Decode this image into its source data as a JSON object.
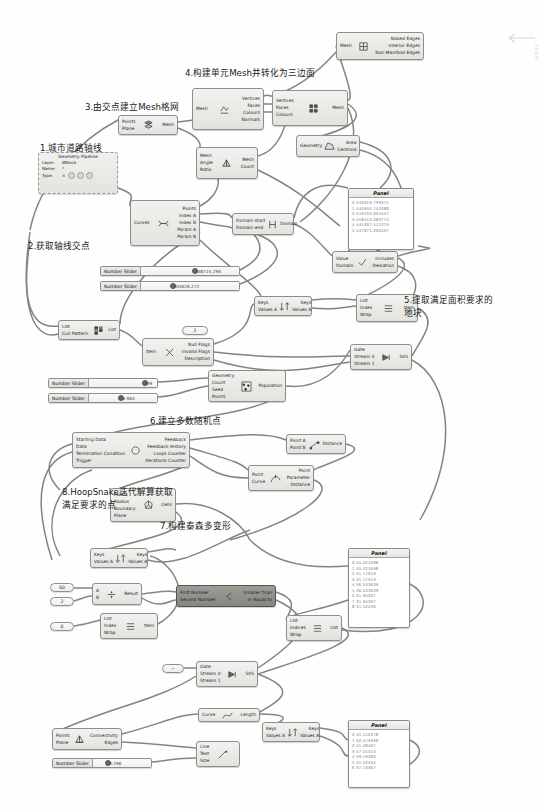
{
  "document": {
    "title": "Grasshopper Definition Canvas",
    "watermark": "ZOOM"
  },
  "annotations": [
    {
      "id": "a1",
      "text": "1.城市道路轴线",
      "x": 40,
      "y": 141
    },
    {
      "id": "a2",
      "text": "2.获取轴线交点",
      "x": 28,
      "y": 239
    },
    {
      "id": "a3",
      "text": "3.由交点建立Mesh格网",
      "x": 85,
      "y": 100
    },
    {
      "id": "a4",
      "text": "4.构建单元Mesh并转化为三边面",
      "x": 185,
      "y": 66
    },
    {
      "id": "a5a",
      "text": "5.提取满足面积要求的",
      "x": 404,
      "y": 293
    },
    {
      "id": "a5b",
      "text": "地块",
      "x": 404,
      "y": 306
    },
    {
      "id": "a6",
      "text": "6.建立多数随机点",
      "x": 150,
      "y": 414
    },
    {
      "id": "a7",
      "text": "7.构建泰森多变形",
      "x": 160,
      "y": 519
    },
    {
      "id": "a8a",
      "text": "8.HoopSnake迭代解算获取",
      "x": 62,
      "y": 485
    },
    {
      "id": "a8b",
      "text": "满足要求的点",
      "x": 62,
      "y": 498
    }
  ],
  "nodes": [
    {
      "id": "n_mesh_edges",
      "name": "mesh-edges-node",
      "x": 336,
      "y": 32,
      "w": 88,
      "h": 28,
      "inputs": [
        "Mesh"
      ],
      "outputs": [
        "Naked Edges",
        "Interior Edges",
        "Non-Manifold Edges"
      ],
      "icon": "mesh-edges-icon",
      "dark": false
    },
    {
      "id": "n_deconstruct_mesh",
      "name": "deconstruct-mesh-node",
      "x": 192,
      "y": 88,
      "w": 72,
      "h": 42,
      "inputs": [
        "Mesh"
      ],
      "outputs": [
        "Vertices",
        "Faces",
        "Colours",
        "Normals"
      ],
      "icon": "deconstruct-mesh-icon",
      "dark": false
    },
    {
      "id": "n_construct_mesh",
      "name": "construct-mesh-node",
      "x": 272,
      "y": 90,
      "w": 76,
      "h": 36,
      "inputs": [
        "Vertices",
        "Faces",
        "Colours"
      ],
      "outputs": [
        "Mesh"
      ],
      "icon": "construct-mesh-icon",
      "dark": false
    },
    {
      "id": "n_mesh_grid",
      "name": "mesh-grid-node",
      "x": 118,
      "y": 115,
      "w": 60,
      "h": 20,
      "inputs": [
        "Points",
        "Plane"
      ],
      "outputs": [
        "Mesh"
      ],
      "icon": "mesh-grid-icon",
      "dark": false
    },
    {
      "id": "n_area",
      "name": "area-node",
      "x": 296,
      "y": 135,
      "w": 64,
      "h": 22,
      "inputs": [
        "Geometry"
      ],
      "outputs": [
        "Area",
        "Centroid"
      ],
      "icon": "area-icon",
      "dark": false
    },
    {
      "id": "n_triangulate",
      "name": "triangulate-mesh-node",
      "x": 196,
      "y": 147,
      "w": 62,
      "h": 32,
      "inputs": [
        "Mesh",
        "Angle",
        "Ratio"
      ],
      "outputs": [
        "Mesh",
        "Count"
      ],
      "icon": "triangulate-icon",
      "dark": false
    },
    {
      "id": "n_ccx",
      "name": "curve-curve-intersection-node",
      "x": 130,
      "y": 200,
      "w": 70,
      "h": 46,
      "inputs": [
        "Curves"
      ],
      "outputs": [
        "Points",
        "Index A",
        "Index B",
        "Param A",
        "Param B"
      ],
      "icon": "intersection-icon",
      "dark": false
    },
    {
      "id": "n_domain",
      "name": "construct-domain-node",
      "x": 232,
      "y": 213,
      "w": 62,
      "h": 22,
      "inputs": [
        "Domain start",
        "Domain end"
      ],
      "outputs": [
        "Domain"
      ],
      "icon": "domain-icon",
      "dark": false
    },
    {
      "id": "n_includes",
      "name": "includes-node",
      "x": 332,
      "y": 251,
      "w": 66,
      "h": 22,
      "inputs": [
        "Value",
        "Domain"
      ],
      "outputs": [
        "Includes",
        "Deviation"
      ],
      "icon": "includes-icon",
      "dark": false
    },
    {
      "id": "n_cull",
      "name": "cull-pattern-node",
      "x": 58,
      "y": 320,
      "w": 62,
      "h": 20,
      "inputs": [
        "List",
        "Cull Pattern"
      ],
      "outputs": [
        "List"
      ],
      "icon": "cull-pattern-icon",
      "dark": false
    },
    {
      "id": "n_nulls",
      "name": "null-item-node",
      "x": 142,
      "y": 338,
      "w": 72,
      "h": 28,
      "inputs": [
        "Item"
      ],
      "outputs": [
        "Null Flags",
        "Invalid Flags",
        "Description"
      ],
      "icon": "null-item-icon",
      "dark": false
    },
    {
      "id": "n_sort1",
      "name": "sort-list-node-1",
      "x": 254,
      "y": 296,
      "w": 58,
      "h": 20,
      "inputs": [
        "Keys",
        "Values A"
      ],
      "outputs": [
        "Keys",
        "Values A"
      ],
      "icon": "sort-icon",
      "dark": false
    },
    {
      "id": "n_listitem1",
      "name": "list-item-node-1",
      "x": 356,
      "y": 294,
      "w": 62,
      "h": 28,
      "inputs": [
        "List",
        "Index",
        "Wrap"
      ],
      "outputs": [
        "Item"
      ],
      "icon": "list-item-icon",
      "dark": false
    },
    {
      "id": "n_gate1",
      "name": "gate-stream-node-1",
      "x": 350,
      "y": 344,
      "w": 62,
      "h": 26,
      "inputs": [
        "Gate",
        "Stream 0",
        "Stream 1"
      ],
      "outputs": [
        "S0S"
      ],
      "icon": "stream-gate-icon",
      "dark": false
    },
    {
      "id": "n_populate",
      "name": "populate-geometry-node",
      "x": 208,
      "y": 370,
      "w": 78,
      "h": 32,
      "inputs": [
        "Geometry",
        "Count",
        "Seed",
        "Points"
      ],
      "outputs": [
        "Population"
      ],
      "icon": "populate-icon",
      "dark": false
    },
    {
      "id": "n_hoopsnake",
      "name": "hoopsnake-node",
      "x": 72,
      "y": 432,
      "w": 118,
      "h": 36,
      "inputs": [
        "Starting Data",
        "Data",
        "Termination Condition",
        "Trigger"
      ],
      "outputs": [
        "Feedback",
        "Feedback History",
        "Loops Counter",
        "Iterations Counter"
      ],
      "icon": "loop-icon",
      "dark": false
    },
    {
      "id": "n_distance",
      "name": "distance-node",
      "x": 286,
      "y": 434,
      "w": 60,
      "h": 20,
      "inputs": [
        "Point A",
        "Point B"
      ],
      "outputs": [
        "Distance"
      ],
      "icon": "distance-icon",
      "dark": false
    },
    {
      "id": "n_curvecp",
      "name": "curve-closest-point-node",
      "x": 248,
      "y": 465,
      "w": 66,
      "h": 26,
      "inputs": [
        "Point",
        "Curve"
      ],
      "outputs": [
        "Point",
        "Parameter",
        "Distance"
      ],
      "icon": "closest-point-icon",
      "dark": false
    },
    {
      "id": "n_voronoi",
      "name": "voronoi-node",
      "x": 110,
      "y": 488,
      "w": 66,
      "h": 34,
      "inputs": [
        "Points",
        "Radius",
        "Boundary",
        "Plane"
      ],
      "outputs": [
        "Cells"
      ],
      "icon": "voronoi-icon",
      "dark": false
    },
    {
      "id": "n_sort2",
      "name": "sort-list-node-2",
      "x": 90,
      "y": 548,
      "w": 58,
      "h": 20,
      "inputs": [
        "Keys",
        "Values A"
      ],
      "outputs": [
        "Keys",
        "Values A"
      ],
      "icon": "sort-icon",
      "dark": false
    },
    {
      "id": "n_divide",
      "name": "division-node",
      "x": 92,
      "y": 583,
      "w": 50,
      "h": 22,
      "inputs": [
        "A",
        "B"
      ],
      "outputs": [
        "Result"
      ],
      "icon": "division-icon",
      "dark": false
    },
    {
      "id": "n_smaller",
      "name": "smaller-than-node",
      "x": 176,
      "y": 585,
      "w": 100,
      "h": 22,
      "inputs": [
        "First Number",
        "Second Number"
      ],
      "outputs": [
        "Smaller than",
        "or Equal to"
      ],
      "icon": "less-than-icon",
      "dark": true
    },
    {
      "id": "n_listitem2",
      "name": "list-item-node-2",
      "x": 100,
      "y": 613,
      "w": 58,
      "h": 26,
      "inputs": [
        "List",
        "Index",
        "Wrap"
      ],
      "outputs": [
        "Item"
      ],
      "icon": "list-item-icon",
      "dark": false
    },
    {
      "id": "n_listitem3",
      "name": "list-item-node-3",
      "x": 286,
      "y": 615,
      "w": 56,
      "h": 26,
      "inputs": [
        "List",
        "Indices",
        "Wrap"
      ],
      "outputs": [
        "List"
      ],
      "icon": "list-item-icon",
      "dark": false
    },
    {
      "id": "n_gate2",
      "name": "gate-stream-node-2",
      "x": 196,
      "y": 661,
      "w": 62,
      "h": 26,
      "inputs": [
        "Gate",
        "Stream 0",
        "Stream 1"
      ],
      "outputs": [
        "S0S"
      ],
      "icon": "stream-gate-icon",
      "dark": false
    },
    {
      "id": "n_delaunay",
      "name": "delaunay-connectivity-node",
      "x": 52,
      "y": 728,
      "w": 70,
      "h": 22,
      "inputs": [
        "Points",
        "Plane"
      ],
      "outputs": [
        "Connectivity",
        "Edges"
      ],
      "icon": "delaunay-icon",
      "dark": false
    },
    {
      "id": "n_curvelen",
      "name": "curve-length-node",
      "x": 198,
      "y": 708,
      "w": 62,
      "h": 14,
      "inputs": [
        "Curve"
      ],
      "outputs": [
        "Length"
      ],
      "icon": "curve-length-icon",
      "dark": false
    },
    {
      "id": "n_sort3",
      "name": "sort-list-node-3",
      "x": 262,
      "y": 722,
      "w": 58,
      "h": 20,
      "inputs": [
        "Keys",
        "Values A"
      ],
      "outputs": [
        "Keys",
        "Values A"
      ],
      "icon": "sort-icon",
      "dark": false
    },
    {
      "id": "n_texttag",
      "name": "text-tag-node",
      "x": 196,
      "y": 741,
      "w": 44,
      "h": 26,
      "inputs": [
        "Line",
        "Text",
        "Size"
      ],
      "outputs": [],
      "icon": "text-tag-icon",
      "dark": false
    }
  ],
  "sliders": [
    {
      "id": "s1",
      "name": "number-slider-1",
      "label": "Number Slider",
      "value": "448714.296",
      "x": 100,
      "y": 266,
      "w": 140,
      "knob": 0.52
    },
    {
      "id": "s2",
      "name": "number-slider-2",
      "label": "Number Slider",
      "value": "604626.272",
      "x": 100,
      "y": 281,
      "w": 140,
      "knob": 0.3
    },
    {
      "id": "s3",
      "name": "number-slider-3",
      "label": "Number Slider",
      "value": "399",
      "x": 48,
      "y": 378,
      "w": 110,
      "knob": 0.78
    },
    {
      "id": "s4",
      "name": "number-slider-4",
      "label": "Number Slider",
      "value": "40.964",
      "x": 48,
      "y": 393,
      "w": 110,
      "knob": 0.42
    },
    {
      "id": "s5",
      "name": "number-slider-5",
      "label": "Number Slider",
      "value": "10.296",
      "x": 52,
      "y": 758,
      "w": 100,
      "knob": 0.2
    }
  ],
  "panels": [
    {
      "id": "p1",
      "name": "panel-coordinates-top",
      "title": "Panel",
      "x": 348,
      "y": 188,
      "w": 66,
      "h": 62,
      "rows": [
        "0 449319.799371",
        "1 445956.742388",
        "2 519103.604457",
        "3 458412.283714",
        "4 445307.511279",
        "5 447871.292407"
      ]
    },
    {
      "id": "p2",
      "name": "panel-values-mid",
      "title": "Panel",
      "x": 348,
      "y": 548,
      "w": 62,
      "h": 80,
      "rows": [
        "0 45.221698",
        "1 45.221698",
        "2 31.17019",
        "3 31.17019",
        "4 36.533639",
        "5 36.533639",
        "6 31.94207",
        "7 31.94207",
        "8 31.52236"
      ]
    },
    {
      "id": "p3",
      "name": "panel-values-bottom",
      "title": "Panel",
      "x": 348,
      "y": 720,
      "w": 62,
      "h": 68,
      "rows": [
        "0 45.116378",
        "1 40.479330",
        "2 41.28407",
        "3 47.55553",
        "4 39.19283",
        "5 41.52334",
        "6 37.13367"
      ]
    }
  ],
  "pipeline": {
    "id": "gp1",
    "name": "geometry-pipeline-node",
    "x": 38,
    "y": 152,
    "w": 80,
    "h": 42,
    "title": "Geometry Pipeline",
    "rows": [
      {
        "key": "Layer:",
        "value": "ØBlock"
      },
      {
        "key": "Name:",
        "value": "*"
      },
      {
        "key": "Type:",
        "value": "×"
      }
    ]
  },
  "value_boxes": [
    {
      "id": "v1",
      "name": "value-box-index",
      "value": "2",
      "x": 182,
      "y": 326,
      "w": 26,
      "h": 9
    },
    {
      "id": "v2",
      "name": "value-box-60",
      "value": "60",
      "x": 50,
      "y": 583,
      "w": 24,
      "h": 9
    },
    {
      "id": "v3",
      "name": "value-box-2",
      "value": "2",
      "x": 50,
      "y": 597,
      "w": 24,
      "h": 9
    },
    {
      "id": "v4",
      "name": "value-box-0",
      "value": "0",
      "x": 50,
      "y": 622,
      "w": 24,
      "h": 9
    },
    {
      "id": "v5",
      "name": "value-box-blank",
      "value": "−",
      "x": 162,
      "y": 664,
      "w": 22,
      "h": 9
    }
  ],
  "colors": {
    "node_fill_light": "#ececea",
    "node_fill_dark": "#96968f",
    "node_border": "#8e8e8a",
    "wire": "#6f6f6b",
    "panel_text": "#7a7a86",
    "background": "#fefefe"
  }
}
